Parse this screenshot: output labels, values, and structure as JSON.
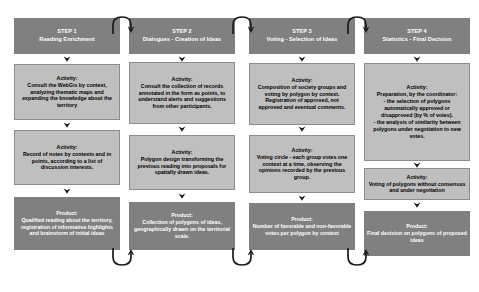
{
  "diagram": {
    "colors": {
      "dark_box": "#808080",
      "light_box": "#bfbfbf",
      "light_box_border": "#8c8c8c",
      "dark_box_text": "#ffffff",
      "light_box_text": "#000000",
      "arrow": "#1a1a1a",
      "background": "#ffffff"
    },
    "icons": {
      "down_arrow": "chevron-down-arrow-icon",
      "link_arc": "curved-connector-arrow-icon"
    },
    "columns": [
      {
        "id": "step-1",
        "header": {
          "step_label": "STEP 1",
          "step_title": "Reading Enrichment"
        },
        "boxes": [
          {
            "kind": "activity",
            "label": "Activity:",
            "text": "Consult the WebGis by context, analyzing thematic maps and expanding the knowledge about the territory"
          },
          {
            "kind": "activity",
            "label": "Activity:",
            "text": "Record of notes by contexto and in points, according to a list of discussion interests."
          },
          {
            "kind": "product",
            "label": "Product:",
            "text": "Qualified reading about the territory, registration of informative highlights and brainstorm of initial ideas"
          }
        ]
      },
      {
        "id": "step-2",
        "header": {
          "step_label": "STEP  2",
          "step_title": "Dialogues - Creation of Ideas"
        },
        "boxes": [
          {
            "kind": "activity",
            "label": "Activity:",
            "text": "Consult the collection of records annotated in the form as points, to understand alerts and suggestions from other participants."
          },
          {
            "kind": "activity",
            "label": "Activity:",
            "text": "Polygon design transforming the previous reading into proposals for spatially drawn ideas."
          },
          {
            "kind": "product",
            "label": "Product:",
            "text": "Collection of polygons of ideas, geographically drawn on the territorial scale."
          }
        ]
      },
      {
        "id": "step-3",
        "header": {
          "step_label": "STEP 3",
          "step_title": "Voting - Selection of Ideas"
        },
        "boxes": [
          {
            "kind": "activity",
            "label": "Activity:",
            "text": "Composition of society groups and voting by polygon by context. Registration of approved, not approved and eventual comments."
          },
          {
            "kind": "activity",
            "label": "Activity:",
            "text": "Voting circle - each group votes one context at a time, observing the opinions recorded by the previous group."
          },
          {
            "kind": "product",
            "label": "Product:",
            "text": "Number of favorable and non-favorable votes per polygon by context"
          }
        ]
      },
      {
        "id": "step-4",
        "header": {
          "step_label": "STEP 4",
          "step_title": "Statistics - Final Decision"
        },
        "boxes": [
          {
            "kind": "activity",
            "label": "Activity:",
            "text": "Preparation, by the coordinator:\n- the selection of polygons automatically approved or disapproved (by % of votes).\n- the analysis of similarity between polygons under negotiation to new votes."
          },
          {
            "kind": "activity",
            "label": "Activity:",
            "text": "Voting of polygons without consensus and under negotiation"
          },
          {
            "kind": "product",
            "label": "Product:",
            "text": "Final decision on polygons of proposed ideas"
          }
        ]
      }
    ]
  }
}
